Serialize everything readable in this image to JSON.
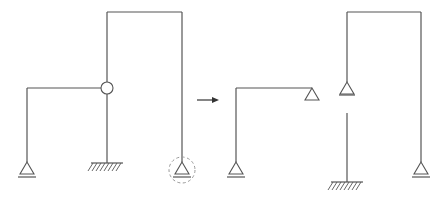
{
  "diagram": {
    "title": "",
    "colors": {
      "member": "#555555",
      "highlight_circle": "#9a9a9a",
      "arrow": "#333333",
      "background": "#ffffff"
    },
    "original_structure": {
      "members": [
        "left-column",
        "left-beam",
        "center-column-upper",
        "center-column-lower",
        "top-beam",
        "right-column"
      ],
      "joints": [
        {
          "type": "hinge",
          "label": ""
        }
      ],
      "supports": [
        {
          "type": "pin",
          "position": "left-column-base"
        },
        {
          "type": "fixed",
          "position": "center-column-base"
        },
        {
          "type": "pin",
          "position": "right-column-base",
          "highlighted": true
        }
      ]
    },
    "transform_arrow": {
      "direction": "right",
      "label": ""
    },
    "decomposed_structures": [
      {
        "name": "left-substructure",
        "members": [
          "column",
          "beam"
        ],
        "supports": [
          {
            "type": "pin",
            "position": "column-base"
          },
          {
            "type": "pin",
            "position": "beam-right-end"
          }
        ]
      },
      {
        "name": "cantilever-column",
        "members": [
          "column"
        ],
        "supports": [
          {
            "type": "fixed",
            "position": "base"
          }
        ]
      },
      {
        "name": "upper-portal",
        "members": [
          "left-column",
          "top-beam",
          "right-column"
        ],
        "supports": [
          {
            "type": "pin",
            "position": "left-column-base"
          },
          {
            "type": "pin",
            "position": "right-column-base"
          }
        ]
      }
    ]
  }
}
